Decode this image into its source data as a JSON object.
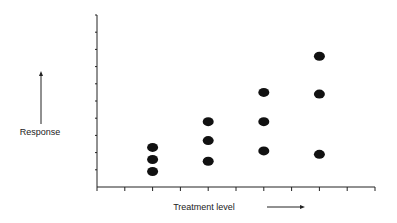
{
  "chart_data": {
    "type": "scatter",
    "title": "",
    "xlabel": "Treatment level",
    "ylabel": "Response",
    "xlim": [
      0,
      10
    ],
    "ylim": [
      0,
      10
    ],
    "x_ticks": [
      0,
      1,
      2,
      3,
      4,
      5,
      6,
      7,
      8,
      9,
      10
    ],
    "y_ticks": [
      0,
      1,
      2,
      3,
      4,
      5,
      6,
      7,
      8,
      9,
      10
    ],
    "tick_labels_shown": false,
    "grid": false,
    "legend": null,
    "series": [
      {
        "name": "observations",
        "points": [
          {
            "x": 2,
            "y": 2.3
          },
          {
            "x": 2,
            "y": 1.6
          },
          {
            "x": 2,
            "y": 0.9
          },
          {
            "x": 4,
            "y": 3.8
          },
          {
            "x": 4,
            "y": 2.7
          },
          {
            "x": 4,
            "y": 1.5
          },
          {
            "x": 6,
            "y": 5.5
          },
          {
            "x": 6,
            "y": 3.8
          },
          {
            "x": 6,
            "y": 2.1
          },
          {
            "x": 8,
            "y": 7.6
          },
          {
            "x": 8,
            "y": 5.4
          },
          {
            "x": 8,
            "y": 1.9
          }
        ],
        "color": "#111111"
      }
    ],
    "annotations": [
      {
        "type": "arrow",
        "direction": "up",
        "near": "ylabel"
      },
      {
        "type": "arrow",
        "direction": "right",
        "near": "xlabel"
      }
    ]
  },
  "labels": {
    "ylabel": "Response",
    "xlabel": "Treatment level"
  }
}
